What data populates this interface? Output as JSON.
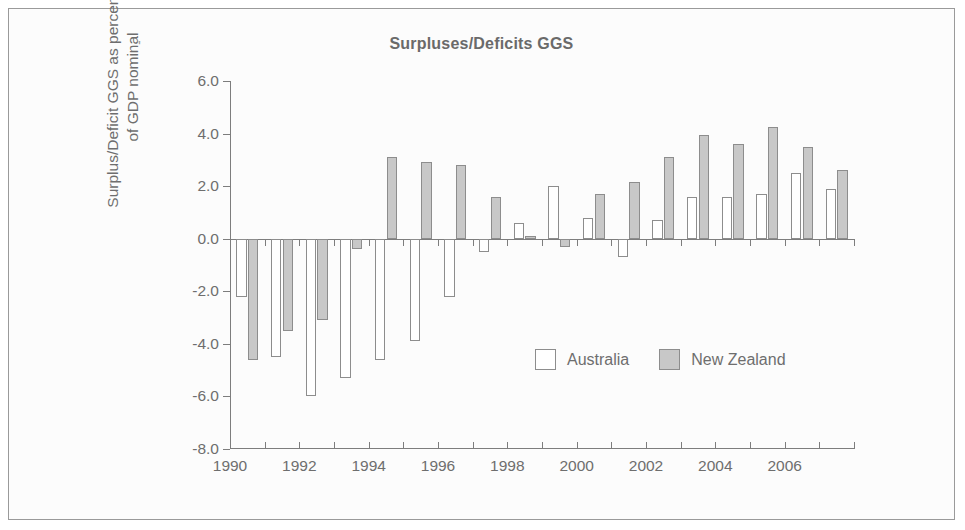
{
  "figure": {
    "title": "Surpluses/Deficits GGS",
    "stray_mark": "'",
    "border_color": "#9a9a9a",
    "background": "#fcfcfc"
  },
  "axes": {
    "ylabel": "Surplus/Deficit GGS as percentage\nof GDP nominal",
    "xlabel": "",
    "ytick_labels": [
      "6.0",
      "4.0",
      "2.0",
      "0.0",
      "-2.0",
      "-4.0",
      "-6.0",
      "-8.0"
    ],
    "ytick_values": [
      6,
      4,
      2,
      0,
      -2,
      -4,
      -6,
      -8
    ],
    "ylim": [
      -8,
      6
    ],
    "xtick_labels": [
      "1990",
      "1992",
      "1994",
      "1996",
      "1998",
      "2000",
      "2002",
      "2004",
      "2006"
    ],
    "xtick_values": [
      1990,
      1992,
      1994,
      1996,
      1998,
      2000,
      2002,
      2004,
      2006
    ],
    "xlim": [
      1990,
      2008
    ]
  },
  "legend": {
    "position": "inside-lower-right",
    "entries": [
      {
        "label": "Australia",
        "color": "#ffffff",
        "swatch": "open-square-swatch"
      },
      {
        "label": "New Zealand",
        "color": "#c8c8c8",
        "swatch": "filled-square-swatch"
      }
    ]
  },
  "chart_data": {
    "type": "bar",
    "title": "Surpluses/Deficits GGS",
    "xlabel": "",
    "ylabel": "Surplus/Deficit GGS as percentage of GDP nominal",
    "ylim": [
      -8,
      6
    ],
    "grid": false,
    "legend_position": "inside-lower-right",
    "categories": [
      "1990",
      "1991",
      "1992",
      "1993",
      "1994",
      "1995",
      "1996",
      "1997",
      "1998",
      "1999",
      "2000",
      "2001",
      "2002",
      "2003",
      "2004",
      "2005",
      "2006",
      "2007"
    ],
    "series": [
      {
        "name": "Australia",
        "color": "#ffffff",
        "values": [
          -2.2,
          -4.5,
          -6.0,
          -5.3,
          -4.6,
          -3.9,
          -2.2,
          -0.5,
          0.6,
          2.0,
          0.8,
          -0.7,
          0.7,
          1.6,
          1.6,
          1.7,
          2.5,
          1.9
        ]
      },
      {
        "name": "New Zealand",
        "color": "#c8c8c8",
        "values": [
          -4.6,
          -3.5,
          -3.1,
          -0.4,
          3.1,
          2.9,
          2.8,
          1.6,
          0.1,
          -0.3,
          1.7,
          2.15,
          3.1,
          3.95,
          3.6,
          4.25,
          3.5,
          2.6
        ]
      }
    ]
  }
}
